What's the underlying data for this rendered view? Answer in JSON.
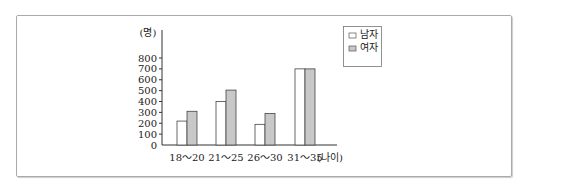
{
  "chart_data": {
    "type": "bar",
    "title": "",
    "xlabel": "(나이)",
    "ylabel": "(명)",
    "categories": [
      "18～20",
      "21～25",
      "26～30",
      "31～35"
    ],
    "series": [
      {
        "name": "남자",
        "values": [
          220,
          400,
          190,
          700
        ],
        "color": "#ffffff"
      },
      {
        "name": "여자",
        "values": [
          310,
          505,
          290,
          700
        ],
        "color": "#c8c8c8"
      }
    ],
    "yticks": [
      0,
      100,
      200,
      300,
      400,
      500,
      600,
      700,
      800
    ],
    "ylim": [
      0,
      800
    ],
    "grid": false,
    "legend_position": "top-right"
  }
}
